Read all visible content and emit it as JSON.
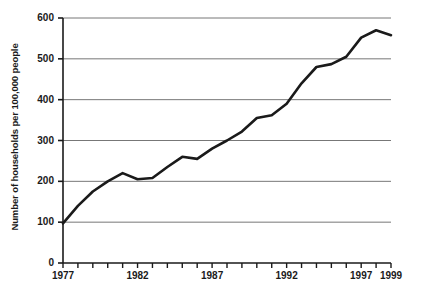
{
  "chart_data": {
    "type": "line",
    "title": "",
    "xlabel": "",
    "ylabel": "Number of households per 100,000 people",
    "xlim": [
      1977,
      1999
    ],
    "ylim": [
      0,
      600
    ],
    "grid": true,
    "legend": null,
    "x_ticks": [
      1977,
      1978,
      1979,
      1980,
      1981,
      1982,
      1983,
      1984,
      1985,
      1986,
      1987,
      1988,
      1989,
      1990,
      1991,
      1992,
      1993,
      1994,
      1995,
      1996,
      1997,
      1998,
      1999
    ],
    "x_tick_labels": [
      "1977",
      "1982",
      "1987",
      "1992",
      "1997",
      "1999"
    ],
    "x_tick_label_values": [
      1977,
      1982,
      1987,
      1992,
      1997,
      1999
    ],
    "y_ticks": [
      0,
      100,
      200,
      300,
      400,
      500,
      600
    ],
    "y_tick_labels": [
      "0",
      "100",
      "200",
      "300",
      "400",
      "500",
      "600"
    ],
    "x": [
      1977,
      1978,
      1979,
      1980,
      1981,
      1982,
      1983,
      1984,
      1985,
      1986,
      1987,
      1988,
      1989,
      1990,
      1991,
      1992,
      1993,
      1994,
      1995,
      1996,
      1997,
      1998,
      1999
    ],
    "values": [
      97,
      140,
      175,
      200,
      220,
      205,
      208,
      235,
      260,
      255,
      280,
      300,
      322,
      355,
      362,
      390,
      440,
      480,
      487,
      505,
      552,
      570,
      558
    ],
    "series": [
      {
        "name": "Households per 100,000 people",
        "color": "#1a1a1a",
        "values": [
          97,
          140,
          175,
          200,
          220,
          205,
          208,
          235,
          260,
          255,
          280,
          300,
          322,
          355,
          362,
          390,
          440,
          480,
          487,
          505,
          552,
          570,
          558
        ]
      }
    ],
    "line_color": "#1a1a1a",
    "gridline_color": "#777777",
    "axis_color": "#1a1a1a"
  }
}
